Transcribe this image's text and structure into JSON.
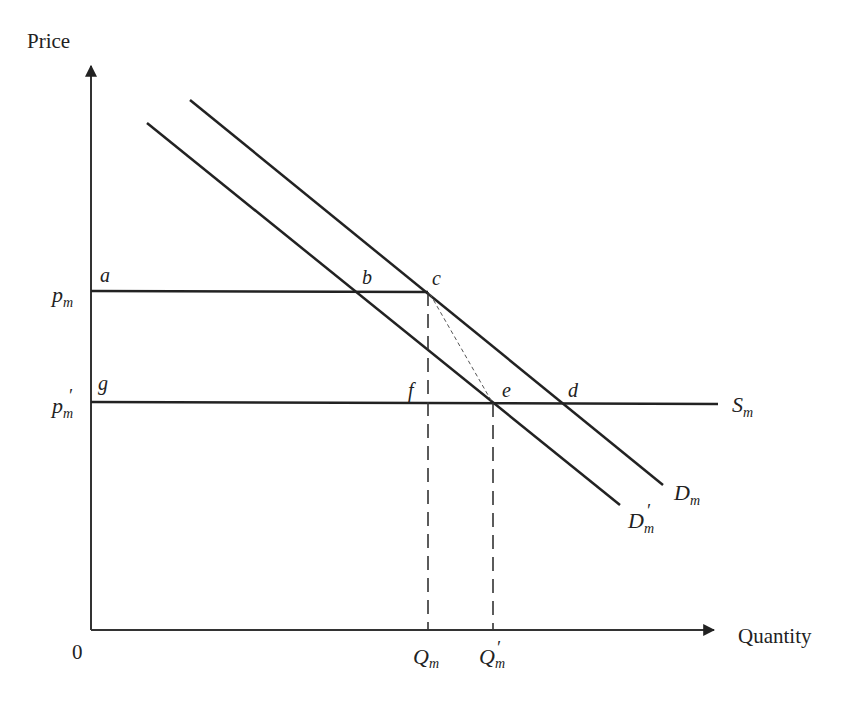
{
  "diagram": {
    "type": "supply-demand",
    "axes": {
      "y_label": "Price",
      "x_label": "Quantity",
      "origin_label": "0"
    },
    "price_levels": [
      {
        "symbol": "p",
        "sub": "m",
        "prime": "",
        "id": "pm"
      },
      {
        "symbol": "p",
        "sub": "m",
        "prime": "′",
        "id": "pm_prime"
      }
    ],
    "quantity_levels": [
      {
        "symbol": "Q",
        "sub": "m",
        "prime": "",
        "id": "Qm"
      },
      {
        "symbol": "Q",
        "sub": "m",
        "prime": "′",
        "id": "Qm_prime"
      }
    ],
    "curves": [
      {
        "symbol": "D",
        "sub": "m",
        "prime": "",
        "id": "Dm"
      },
      {
        "symbol": "D",
        "sub": "m",
        "prime": "′",
        "id": "Dm_prime"
      },
      {
        "symbol": "S",
        "sub": "m",
        "prime": "",
        "id": "Sm"
      }
    ],
    "points": [
      "a",
      "b",
      "c",
      "d",
      "e",
      "f",
      "g"
    ],
    "colors": {
      "line": "#222222",
      "background": "#ffffff"
    }
  }
}
